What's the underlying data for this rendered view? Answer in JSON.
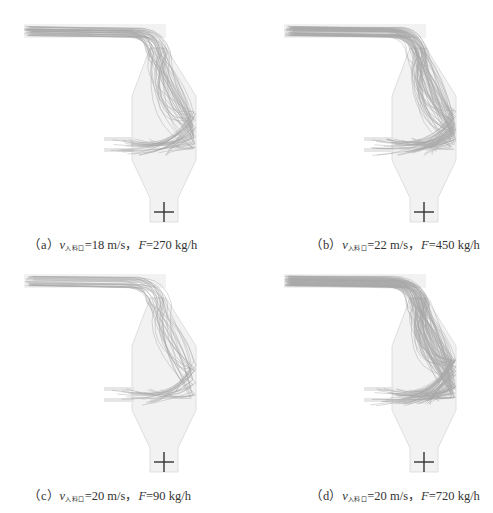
{
  "figure": {
    "panels": [
      {
        "id": "a",
        "label": "（a）",
        "velocity_symbol": "v",
        "velocity_subscript": "入料口",
        "velocity_value": "=18 m/s，",
        "feed_symbol": "F",
        "feed_value": "=270 kg/h",
        "v_mps": 18,
        "F_kgph": 270,
        "trajectory_density": 40
      },
      {
        "id": "b",
        "label": "（b）",
        "velocity_symbol": "v",
        "velocity_subscript": "入料口",
        "velocity_value": "=22 m/s，",
        "feed_symbol": "F",
        "feed_value": "=450 kg/h",
        "v_mps": 22,
        "F_kgph": 450,
        "trajectory_density": 55
      },
      {
        "id": "c",
        "label": "（c）",
        "velocity_symbol": "v",
        "velocity_subscript": "入料口",
        "velocity_value": "=20 m/s，",
        "feed_symbol": "F",
        "feed_value": "=90 kg/h",
        "v_mps": 20,
        "F_kgph": 90,
        "trajectory_density": 25
      },
      {
        "id": "d",
        "label": "（d）",
        "velocity_symbol": "v",
        "velocity_subscript": "入料口",
        "velocity_value": "=20 m/s，",
        "feed_symbol": "F",
        "feed_value": "=720 kg/h",
        "v_mps": 20,
        "F_kgph": 720,
        "trajectory_density": 75
      }
    ]
  },
  "colors": {
    "background": "#ffffff",
    "vessel_fill": "#f2f2f2",
    "vessel_edge": "#d8d8d8",
    "trajectory": "#6e6e6e",
    "marker": "#333333",
    "caption": "#333333"
  }
}
